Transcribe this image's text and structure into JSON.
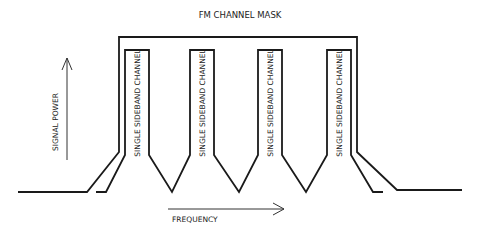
{
  "title": "FM CHANNEL MASK",
  "axes": {
    "y_label": "SIGNAL POWER",
    "x_label": "FREQUENCY"
  },
  "channels": [
    {
      "label": "SINGLE SIDEBAND CHANNEL"
    },
    {
      "label": "SINGLE SIDEBAND CHANNEL"
    },
    {
      "label": "SINGLE SIDEBAND CHANNEL"
    },
    {
      "label": "SINGLE SIDEBAND CHANNEL"
    }
  ],
  "colors": {
    "line": "#1a1a1a",
    "background": "#ffffff"
  }
}
